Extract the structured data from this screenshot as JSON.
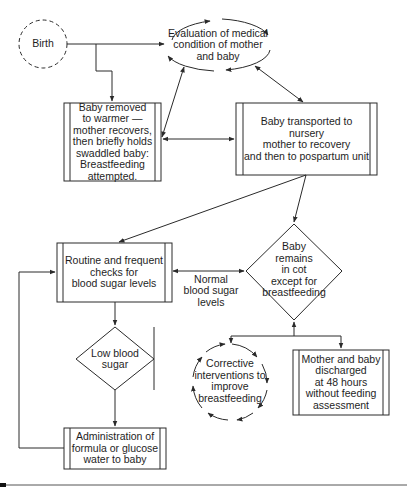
{
  "diagram": {
    "type": "flowchart",
    "colors": {
      "stroke": "#2a2a2a",
      "background": "#ffffff",
      "text": "#1e1e1e"
    },
    "nodes": {
      "birth": {
        "label": "Birth",
        "shape": "dashed-circle"
      },
      "evaluation": {
        "label": "Evaluation of medical\ncondition of mother\nand baby",
        "shape": "cyclic-ellipse"
      },
      "warmer": {
        "label": "Baby removed\nto warmer —\nmother recovers,\nthen briefly holds\nswaddled baby:\nBreastfeeding\nattempted.",
        "shape": "process-box"
      },
      "nursery": {
        "label": "Baby transported to nursery\nmother to recovery\nand then to pospartum unit",
        "shape": "process-box"
      },
      "routine_checks": {
        "label": "Routine and frequent\nchecks for\nblood sugar levels",
        "shape": "process-box"
      },
      "remains_in_cot": {
        "label": "Baby\nremains\nin cot\nexcept for\nbreastfeeding",
        "shape": "diamond"
      },
      "low_blood_sugar": {
        "label": "Low blood\nsugar",
        "shape": "diamond"
      },
      "administration": {
        "label": "Administration of\nformula or glucose\nwater to baby",
        "shape": "process-box"
      },
      "corrective": {
        "label": "Corrective\ninterventions to\nimprove\nbreastfeeding",
        "shape": "cyclic-circle"
      },
      "discharged": {
        "label": "Mother and baby\ndischarged\nat 48 hours\nwithout feeding\nassessment",
        "shape": "process-box"
      }
    },
    "edge_labels": {
      "normal_blood_sugar": "Normal\nblood sugar\nlevels"
    },
    "edges": [
      {
        "from": "birth",
        "to": "evaluation"
      },
      {
        "from": "birth",
        "to": "warmer"
      },
      {
        "from": "warmer",
        "to": "evaluation",
        "bidirectional": true
      },
      {
        "from": "evaluation",
        "to": "nursery",
        "bidirectional": true
      },
      {
        "from": "warmer",
        "to": "nursery",
        "bidirectional": true
      },
      {
        "from": "nursery",
        "to": "routine_checks"
      },
      {
        "from": "nursery",
        "to": "remains_in_cot"
      },
      {
        "from": "routine_checks",
        "to": "remains_in_cot",
        "bidirectional": true,
        "label": "normal_blood_sugar"
      },
      {
        "from": "routine_checks",
        "to": "low_blood_sugar"
      },
      {
        "from": "low_blood_sugar",
        "to": "administration"
      },
      {
        "from": "administration",
        "to": "routine_checks"
      },
      {
        "from": "remains_in_cot",
        "to": "corrective"
      },
      {
        "from": "remains_in_cot",
        "to": "discharged"
      }
    ]
  }
}
